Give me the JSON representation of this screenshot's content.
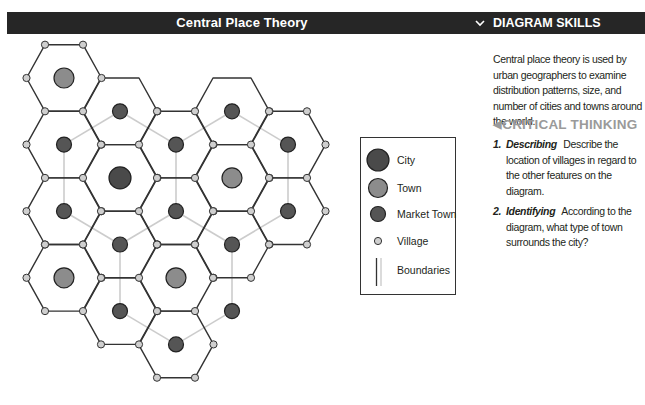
{
  "header": {
    "title": "Central Place Theory",
    "panel_title": "DIAGRAM SKILLS",
    "panel_toggle_icon": "chevron-down-icon"
  },
  "panel": {
    "intro": "Central place theory is used by urban geographers to examine distribution patterns, size, and number of cities and towns around the world.",
    "critical_thinking": {
      "icon": "triangle-left-icon",
      "heading": "CRITICAL THINKING",
      "questions": [
        {
          "number": "1.",
          "skill": "Describing",
          "text": "Describe the location of villages in regard to the other features on the diagram."
        },
        {
          "number": "2.",
          "skill": "Identifying",
          "text": "According to the diagram, what type of town surrounds the city?"
        }
      ]
    }
  },
  "legend": {
    "items": [
      {
        "key": "city",
        "label": "City"
      },
      {
        "key": "town",
        "label": "Town"
      },
      {
        "key": "market_town",
        "label": "Market Town"
      },
      {
        "key": "village",
        "label": "Village"
      },
      {
        "key": "boundary",
        "label": "Boundaries"
      }
    ]
  },
  "colors": {
    "header_bg": "#262626",
    "city": "#4a4a4a",
    "town": "#8c8c8c",
    "market_town": "#555555",
    "village": "#cfcfcf",
    "hex_edge": "#333333",
    "connector": "#cccccc",
    "critical_heading": "#9a9a9a"
  },
  "diagram": {
    "cells": [
      {
        "col": 0,
        "row": 0,
        "type": "town"
      },
      {
        "col": 0,
        "row": 2,
        "type": "market_town"
      },
      {
        "col": 0,
        "row": 4,
        "type": "market_town"
      },
      {
        "col": 0,
        "row": 6,
        "type": "town"
      },
      {
        "col": 1,
        "row": 1,
        "type": "market_town"
      },
      {
        "col": 1,
        "row": 3,
        "type": "city"
      },
      {
        "col": 1,
        "row": 5,
        "type": "market_town"
      },
      {
        "col": 1,
        "row": 7,
        "type": "market_town"
      },
      {
        "col": 2,
        "row": 2,
        "type": "market_town"
      },
      {
        "col": 2,
        "row": 4,
        "type": "market_town"
      },
      {
        "col": 2,
        "row": 6,
        "type": "town"
      },
      {
        "col": 2,
        "row": 8,
        "type": "market_town"
      },
      {
        "col": 3,
        "row": 1,
        "type": "market_town"
      },
      {
        "col": 3,
        "row": 3,
        "type": "town"
      },
      {
        "col": 3,
        "row": 5,
        "type": "market_town"
      },
      {
        "col": 3,
        "row": 7,
        "type": "market_town"
      },
      {
        "col": 4,
        "row": 2,
        "type": "market_town"
      },
      {
        "col": 4,
        "row": 4,
        "type": "market_town"
      }
    ],
    "hexagons": [
      [
        0,
        0
      ],
      [
        0,
        2
      ],
      [
        0,
        4
      ],
      [
        0,
        6
      ],
      [
        1,
        1
      ],
      [
        1,
        3
      ],
      [
        1,
        5
      ],
      [
        1,
        7
      ],
      [
        2,
        2
      ],
      [
        2,
        4
      ],
      [
        2,
        6
      ],
      [
        2,
        8
      ],
      [
        3,
        1
      ],
      [
        3,
        3
      ],
      [
        3,
        5
      ],
      [
        4,
        2
      ],
      [
        4,
        4
      ]
    ],
    "connectors": [
      [
        [
          0,
          2
        ],
        [
          1,
          1
        ]
      ],
      [
        [
          1,
          1
        ],
        [
          2,
          2
        ]
      ],
      [
        [
          2,
          2
        ],
        [
          3,
          1
        ]
      ],
      [
        [
          3,
          1
        ],
        [
          4,
          2
        ]
      ],
      [
        [
          0,
          2
        ],
        [
          0,
          4
        ]
      ],
      [
        [
          2,
          2
        ],
        [
          2,
          4
        ]
      ],
      [
        [
          4,
          2
        ],
        [
          4,
          4
        ]
      ],
      [
        [
          0,
          4
        ],
        [
          1,
          5
        ]
      ],
      [
        [
          1,
          5
        ],
        [
          2,
          4
        ]
      ],
      [
        [
          2,
          4
        ],
        [
          3,
          5
        ]
      ],
      [
        [
          3,
          5
        ],
        [
          4,
          4
        ]
      ],
      [
        [
          1,
          5
        ],
        [
          1,
          7
        ]
      ],
      [
        [
          3,
          5
        ],
        [
          3,
          7
        ]
      ],
      [
        [
          1,
          7
        ],
        [
          2,
          8
        ]
      ],
      [
        [
          2,
          8
        ],
        [
          3,
          7
        ]
      ]
    ]
  }
}
